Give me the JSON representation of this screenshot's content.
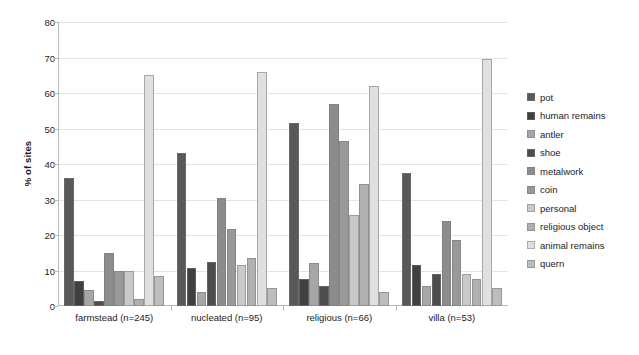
{
  "chart_data": {
    "type": "bar",
    "title": "",
    "xlabel": "",
    "ylabel": "% of sites",
    "ylim": [
      0,
      80
    ],
    "yticks": [
      0,
      10,
      20,
      30,
      40,
      50,
      60,
      70,
      80
    ],
    "grid": true,
    "legend_position": "right",
    "categories": [
      "farmstead (n=245)",
      "nucleated (n=95)",
      "religious (n=66)",
      "villa (n=53)"
    ],
    "series": [
      {
        "name": "pot",
        "color": "#595959",
        "values": [
          36.0,
          43.0,
          51.5,
          37.5
        ]
      },
      {
        "name": "human remains",
        "color": "#404040",
        "values": [
          7.0,
          10.8,
          7.5,
          11.5
        ]
      },
      {
        "name": "antler",
        "color": "#a6a6a6",
        "values": [
          4.5,
          4.0,
          12.0,
          5.5
        ]
      },
      {
        "name": "shoe",
        "color": "#4d4d4d",
        "values": [
          1.5,
          12.3,
          5.5,
          9.0
        ]
      },
      {
        "name": "metalwork",
        "color": "#8c8c8c",
        "values": [
          15.0,
          30.3,
          57.0,
          24.0
        ]
      },
      {
        "name": "coin",
        "color": "#999999",
        "values": [
          10.0,
          21.8,
          46.5,
          18.5
        ]
      },
      {
        "name": "personal",
        "color": "#c9c9c9",
        "values": [
          10.0,
          11.5,
          25.5,
          9.0
        ]
      },
      {
        "name": "religious object",
        "color": "#b0b0b0",
        "values": [
          2.0,
          13.5,
          34.5,
          7.5
        ]
      },
      {
        "name": "animal remains",
        "color": "#e0e0e0",
        "values": [
          65.0,
          66.0,
          62.0,
          69.5
        ]
      },
      {
        "name": "quern",
        "color": "#bdbdbd",
        "values": [
          8.5,
          5.0,
          4.0,
          5.0
        ]
      }
    ]
  }
}
